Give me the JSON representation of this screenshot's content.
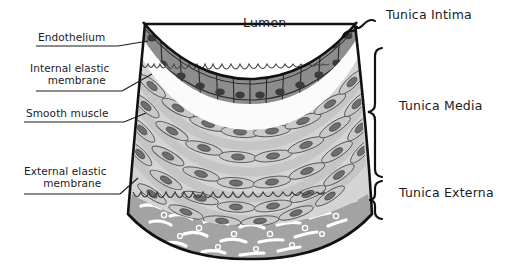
{
  "figure": {
    "background_color": "#ffffff",
    "ink_color": "#1b1b1b"
  },
  "lumen_label": {
    "text": "Lumen",
    "x": 243,
    "y": 18
  },
  "left_labels": [
    {
      "id": "endothelium",
      "line1": "Endothelium",
      "line2": "",
      "x": 38,
      "y": 31,
      "underline_x1": 36,
      "underline_x2": 118,
      "underline_y": 46,
      "leader": "M118,46 L148,41"
    },
    {
      "id": "internal-elastic-membrane",
      "line1": "Internal elastic",
      "line2": "membrane",
      "x": 30,
      "y": 64,
      "underline_x1": 36,
      "underline_x2": 122,
      "underline_y": 91,
      "leader": "M122,91 L152,74"
    },
    {
      "id": "smooth-muscle",
      "line1": "Smooth muscle",
      "line2": "",
      "x": 24,
      "y": 107,
      "underline_x1": 24,
      "underline_x2": 124,
      "underline_y": 122,
      "leader": "M124,122 L146,113"
    },
    {
      "id": "external-elastic-membrane",
      "line1": "External elastic",
      "line2": "membrane",
      "x": 24,
      "y": 167,
      "underline_x1": 24,
      "underline_x2": 120,
      "underline_y": 194,
      "leader": "M120,194 L138,178"
    }
  ],
  "right_labels": [
    {
      "id": "tunica-intima",
      "text": "Tunica Intima",
      "x": 386,
      "y": 9,
      "brace_kind": "small-tilted",
      "brace_top": 27,
      "brace_bottom": 42
    },
    {
      "id": "tunica-media",
      "text": "Tunica Media",
      "x": 399,
      "y": 105,
      "brace_kind": "tall",
      "brace_top": 47,
      "brace_bottom": 177
    },
    {
      "id": "tunica-externa",
      "text": "Tunica Externa",
      "x": 399,
      "y": 192,
      "brace_kind": "short",
      "brace_top": 180,
      "brace_bottom": 219
    }
  ],
  "layers": [
    {
      "id": "lumen",
      "name": "Lumen",
      "color": "#ffffff"
    },
    {
      "id": "endothelium",
      "name": "Endothelium",
      "color": "#8e8e8e"
    },
    {
      "id": "internal-elastic",
      "name": "Internal elastic membrane",
      "color": "#fdfdfd"
    },
    {
      "id": "tunica-media",
      "name": "Tunica media",
      "color": "#d2d2d2"
    },
    {
      "id": "external-elastic",
      "name": "External elastic membrane",
      "color": "#6f6f6f"
    },
    {
      "id": "tunica-externa",
      "name": "Tunica externa",
      "color": "#a0a0a0"
    }
  ]
}
